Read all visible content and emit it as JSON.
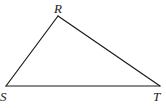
{
  "diagram": {
    "type": "triangle",
    "vertices": [
      {
        "id": "R",
        "label": "R",
        "x": 58,
        "y": 16,
        "label_x": 54,
        "label_y": 13
      },
      {
        "id": "S",
        "label": "S",
        "x": 6,
        "y": 86,
        "label_x": 0,
        "label_y": 101
      },
      {
        "id": "T",
        "label": "T",
        "x": 160,
        "y": 86,
        "label_x": 153,
        "label_y": 101
      }
    ],
    "edges": [
      {
        "from": "R",
        "to": "S"
      },
      {
        "from": "S",
        "to": "T"
      },
      {
        "from": "T",
        "to": "R"
      }
    ],
    "stroke_color": "#1a1a1a",
    "background": "#ffffff"
  }
}
